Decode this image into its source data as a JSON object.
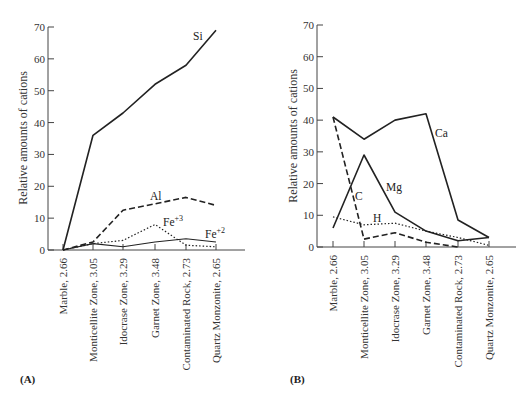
{
  "chart_data": [
    {
      "panel": "(A)",
      "type": "line",
      "ylabel": "Relative amounts of cations",
      "xlabel": "",
      "ylim": [
        0,
        70
      ],
      "yticks": [
        0,
        10,
        20,
        30,
        40,
        50,
        60,
        70
      ],
      "grid": false,
      "categories": [
        "Marble, 2.66",
        "Monticellite Zone, 3.05",
        "Idocrase Zone, 3.29",
        "Garnet Zone, 3.48",
        "Contaminated Rock, 2.73",
        "Quartz Monzonite, 2.65"
      ],
      "series": [
        {
          "name": "Si",
          "style": "solid",
          "values": [
            0,
            36,
            43,
            52,
            58,
            69
          ]
        },
        {
          "name": "Al",
          "style": "dashed",
          "values": [
            0,
            2.5,
            12.5,
            14.5,
            16.5,
            14
          ]
        },
        {
          "name": "Fe+3",
          "style": "dotted",
          "values": [
            0,
            2,
            3,
            8,
            1.5,
            1
          ]
        },
        {
          "name": "Fe+2",
          "style": "solid-thin",
          "values": [
            0,
            2,
            1,
            2.5,
            3.5,
            2.5
          ]
        }
      ]
    },
    {
      "panel": "(B)",
      "type": "line",
      "ylabel": "Relative amounts of cations",
      "xlabel": "",
      "ylim": [
        0,
        70
      ],
      "yticks": [
        0,
        10,
        20,
        30,
        40,
        50,
        60,
        70
      ],
      "grid": false,
      "categories": [
        "Marble, 2.66",
        "Monticellite Zone, 3.05",
        "Idocrase Zone, 3.29",
        "Garnet Zone, 3.48",
        "Contaminated Rock, 2.73",
        "Quartz Monzonite, 2.65"
      ],
      "series": [
        {
          "name": "Ca",
          "style": "solid",
          "values": [
            41,
            34,
            40,
            42,
            8.5,
            3
          ]
        },
        {
          "name": "Mg",
          "style": "solid",
          "values": [
            6,
            29,
            11,
            5,
            2,
            3
          ]
        },
        {
          "name": "C",
          "style": "dashed",
          "values": [
            41,
            2.5,
            4.5,
            1.5,
            0,
            null
          ]
        },
        {
          "name": "H",
          "style": "dotted",
          "values": [
            9.5,
            7,
            7.5,
            5,
            3,
            0.5
          ]
        }
      ]
    }
  ],
  "labels": {
    "panelA": {
      "panel": "(A)",
      "ylabel": "Relative amounts of cations",
      "si": "Si",
      "al": "Al",
      "fe3_base": "Fe",
      "fe3_sup": "+3",
      "fe2_base": "Fe",
      "fe2_sup": "+2"
    },
    "panelB": {
      "panel": "(B)",
      "ylabel": "Relative amounts of cations",
      "ca": "Ca",
      "mg": "Mg",
      "c": "C",
      "h": "H"
    }
  }
}
